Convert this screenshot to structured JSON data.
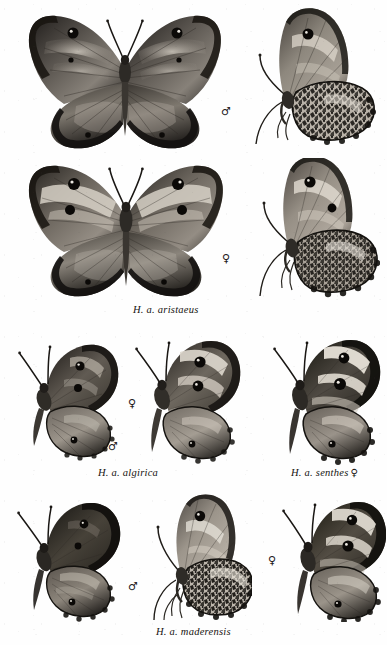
{
  "plate": {
    "kind": "scientific-illustration-plate",
    "subject": "Hipparchia aristaeus subspecies",
    "background_color": "#ffffff",
    "ink_color": "#15120f",
    "rendering": "grayscale halftone photographic plate",
    "width": 387,
    "height": 645
  },
  "symbols": {
    "male": "♂",
    "female": "♀"
  },
  "rows": [
    {
      "id": "row-1",
      "caption": null,
      "specimens": [
        {
          "name": "aristaeus-male-dorsal",
          "view": "dorsal",
          "sex": "male",
          "orientation": "spread wings, upperside",
          "x": 20,
          "y": 8,
          "width": 210,
          "height": 148
        },
        {
          "name": "aristaeus-male-ventral",
          "view": "ventral",
          "sex": "male",
          "orientation": "lateral, underside",
          "x": 238,
          "y": 8,
          "width": 140,
          "height": 140
        }
      ],
      "sex_marks": [
        {
          "name": "male-symbol-row-1",
          "symbol": "♂",
          "x": 221,
          "y": 106
        }
      ]
    },
    {
      "id": "row-2",
      "caption": {
        "name": "caption-aristaeus",
        "text": "H. a. aristaeus",
        "sex_suffix": null,
        "x": 133,
        "y": 304
      },
      "specimens": [
        {
          "name": "aristaeus-female-dorsal",
          "view": "dorsal",
          "sex": "female",
          "orientation": "spread wings, upperside",
          "x": 20,
          "y": 160,
          "width": 212,
          "height": 140
        },
        {
          "name": "aristaeus-female-ventral",
          "view": "ventral",
          "sex": "female",
          "orientation": "lateral, underside",
          "x": 240,
          "y": 158,
          "width": 140,
          "height": 142
        }
      ],
      "sex_marks": [
        {
          "name": "female-symbol-row-2",
          "symbol": "♀",
          "x": 222,
          "y": 253
        }
      ]
    },
    {
      "id": "row-3",
      "captions": [
        {
          "name": "caption-algirica",
          "text": "H. a. algirica",
          "sex_suffix": null,
          "x": 98,
          "y": 467
        },
        {
          "name": "caption-senthes",
          "text": "H. a. senthes",
          "sex_suffix": "♀",
          "x": 291,
          "y": 467
        }
      ],
      "specimens": [
        {
          "name": "algirica-male-dorsal",
          "view": "dorsal",
          "sex": "male",
          "orientation": "half-spread, upperside",
          "x": 12,
          "y": 336,
          "width": 112,
          "height": 126
        },
        {
          "name": "algirica-female-dorsal",
          "view": "dorsal",
          "sex": "female",
          "orientation": "half-spread, upperside",
          "x": 128,
          "y": 334,
          "width": 118,
          "height": 132
        },
        {
          "name": "senthes-female-dorsal",
          "view": "dorsal",
          "sex": "female",
          "orientation": "half-spread, upperside",
          "x": 268,
          "y": 334,
          "width": 116,
          "height": 132
        }
      ],
      "sex_marks": [
        {
          "name": "female-symbol-algirica",
          "symbol": "♀",
          "x": 128,
          "y": 398
        },
        {
          "name": "male-symbol-algirica",
          "symbol": "♂",
          "x": 108,
          "y": 441
        }
      ]
    },
    {
      "id": "row-4",
      "caption": {
        "name": "caption-maderensis",
        "text": "H. a. maderensis",
        "sex_suffix": null,
        "x": 156,
        "y": 626
      },
      "specimens": [
        {
          "name": "maderensis-male-dorsal",
          "view": "dorsal",
          "sex": "male",
          "orientation": "half-spread, upperside",
          "x": 12,
          "y": 496,
          "width": 112,
          "height": 126
        },
        {
          "name": "maderensis-male-ventral",
          "view": "ventral",
          "sex": "male",
          "orientation": "lateral, underside",
          "x": 148,
          "y": 494,
          "width": 104,
          "height": 128
        },
        {
          "name": "maderensis-female-dorsal",
          "view": "dorsal",
          "sex": "female",
          "orientation": "half-spread, upperside",
          "x": 278,
          "y": 496,
          "width": 108,
          "height": 126
        }
      ],
      "sex_marks": [
        {
          "name": "male-symbol-maderensis",
          "symbol": "♂",
          "x": 128,
          "y": 581
        },
        {
          "name": "female-symbol-maderensis",
          "symbol": "♀",
          "x": 268,
          "y": 555
        }
      ]
    }
  ]
}
